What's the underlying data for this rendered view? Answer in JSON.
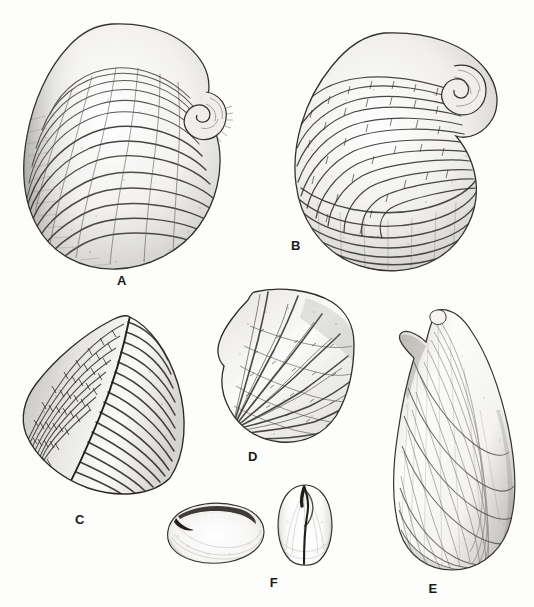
{
  "plate": {
    "kind": "scientific-illustration-plate",
    "subject": "fossil bivalve shells, pen-and-ink stipple drawings",
    "background_color": "#fdfdfc",
    "ink_color": "#2b2b2b",
    "width": 534,
    "height": 607
  },
  "figures": [
    {
      "id": "A",
      "label": "A",
      "label_x": 112,
      "label_y": 274,
      "name": "large-coiled-bivalve-valve",
      "description": "Large ovate valve with strong irregular concentric growth rugae and a tightly coiled spiral umbo at the upper right",
      "bounds": {
        "x": 20,
        "y": 20,
        "w": 218,
        "h": 252
      }
    },
    {
      "id": "B",
      "label": "B",
      "label_x": 286,
      "label_y": 239,
      "name": "radially-ribbed-coiled-valve",
      "description": "Sub-circular valve with coarse beaded radial ribs fanning from a coiled spiral umbo at upper right and concentric lamellae along the lower margin",
      "bounds": {
        "x": 288,
        "y": 30,
        "w": 222,
        "h": 245
      }
    },
    {
      "id": "C",
      "label": "C",
      "label_x": 70,
      "label_y": 513,
      "name": "wedge-shaped-ribbed-valve",
      "description": "Triangular wedge-shaped valve with a sharp median carina, fine transverse ribs on the right flank and a cross-hatched crenulate area on the left flank",
      "bounds": {
        "x": 20,
        "y": 312,
        "w": 170,
        "h": 188
      }
    },
    {
      "id": "D",
      "label": "D",
      "label_x": 243,
      "label_y": 450,
      "name": "fan-shaped-ribbed-valve",
      "description": "Fan-shaped valve with broad radiating ribs diverging from a narrow beak at the lower left, ribs crossed by fine transverse growth striae",
      "bounds": {
        "x": 214,
        "y": 284,
        "w": 146,
        "h": 164
      }
    },
    {
      "id": "E",
      "label": "E",
      "label_x": 423,
      "label_y": 582,
      "name": "elongate-mytiliform-valve",
      "description": "Elongate mussel-shaped valve, pointed beak at top, broadly rounded posterior margin, covered by fine concentric growth lines",
      "bounds": {
        "x": 388,
        "y": 306,
        "w": 140,
        "h": 270
      }
    },
    {
      "id": "F",
      "label": "F",
      "label_x": 264,
      "label_y": 576,
      "name": "small-smooth-bivalve-two-views",
      "description": "Small smooth bivalve shown in two views: dorsal view with dark ligament groove along the hinge, and anterior view showing the closed commissure",
      "views": [
        {
          "name": "dorsal-hinge-view",
          "bounds": {
            "x": 164,
            "y": 494,
            "w": 104,
            "h": 72
          }
        },
        {
          "name": "anterior-commissure-view",
          "bounds": {
            "x": 274,
            "y": 482,
            "w": 62,
            "h": 88
          }
        }
      ]
    }
  ]
}
